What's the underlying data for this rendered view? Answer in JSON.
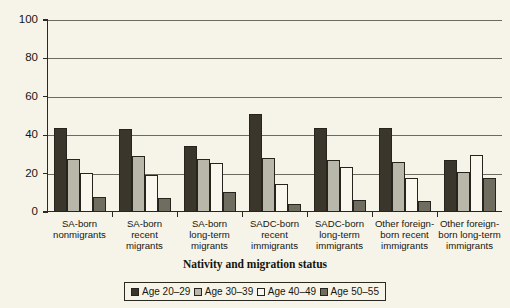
{
  "chart_data": {
    "type": "bar",
    "title": "",
    "xlabel": "Nativity and migration status",
    "ylabel": "",
    "ylim": [
      0,
      100
    ],
    "yticks": [
      "0",
      "20",
      "40",
      "60",
      "80",
      "100"
    ],
    "grid": true,
    "legend_position": "bottom",
    "categories": [
      "SA-born nonmigrants",
      "SA-born recent migrants",
      "SA-born long-term migrants",
      "SADC-born recent immigrants",
      "SADC-born long-term immigrants",
      "Other foreign-born recent immigrants",
      "Other foreign-born long-term immigrants"
    ],
    "category_lines": [
      [
        "SA-born",
        "nonmigrants"
      ],
      [
        "SA-born",
        "recent",
        "migrants"
      ],
      [
        "SA-born",
        "long-term",
        "migrants"
      ],
      [
        "SADC-born",
        "recent",
        "immigrants"
      ],
      [
        "SADC-born",
        "long-term",
        "immigrants"
      ],
      [
        "Other foreign-",
        "born recent",
        "immigrants"
      ],
      [
        "Other foreign-",
        "born long-term",
        "immigrants"
      ]
    ],
    "series": [
      {
        "name": "Age 20–29",
        "color": "#3a362c",
        "values": [
          44,
          43,
          34.5,
          51,
          44,
          44,
          27
        ]
      },
      {
        "name": "Age 30–39",
        "color": "#b9b6aa",
        "values": [
          27.5,
          29,
          27.5,
          28,
          27,
          26,
          21
        ]
      },
      {
        "name": "Age 40–49",
        "color": "#faf8ee",
        "values": [
          20.5,
          19.5,
          25.5,
          14.5,
          23.5,
          17.5,
          29.5
        ]
      },
      {
        "name": "Age 50–55",
        "color": "#6f6c60",
        "values": [
          8,
          7.5,
          10.5,
          4,
          6,
          5.5,
          17.5
        ]
      }
    ]
  }
}
